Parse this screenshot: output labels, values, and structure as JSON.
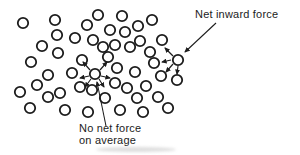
{
  "figure": {
    "type": "physics-diagram",
    "background_color": "#ffffff",
    "ink_color": "#1c1c1c",
    "labels": {
      "net_inward_force": "Net inward force",
      "no_net_force_line1": "No net force",
      "no_net_force_line2": "on average"
    },
    "molecule_radius": 5.2,
    "molecules": [
      [
        23,
        23
      ],
      [
        55,
        20
      ],
      [
        87,
        25
      ],
      [
        98,
        15
      ],
      [
        122,
        16
      ],
      [
        138,
        26
      ],
      [
        152,
        20
      ],
      [
        57,
        35
      ],
      [
        75,
        38
      ],
      [
        93,
        40
      ],
      [
        110,
        30
      ],
      [
        125,
        32
      ],
      [
        140,
        41
      ],
      [
        162,
        40
      ],
      [
        42,
        46
      ],
      [
        58,
        53
      ],
      [
        103,
        47
      ],
      [
        115,
        45
      ],
      [
        130,
        47
      ],
      [
        150,
        52
      ],
      [
        31,
        62
      ],
      [
        82,
        60
      ],
      [
        108,
        57
      ],
      [
        117,
        68
      ],
      [
        135,
        72
      ],
      [
        154,
        63
      ],
      [
        48,
        75
      ],
      [
        72,
        73
      ],
      [
        161,
        76
      ],
      [
        177,
        80
      ],
      [
        37,
        85
      ],
      [
        60,
        93
      ],
      [
        80,
        87
      ],
      [
        92,
        90
      ],
      [
        115,
        83
      ],
      [
        127,
        88
      ],
      [
        146,
        86
      ],
      [
        20,
        92
      ],
      [
        48,
        97
      ],
      [
        105,
        98
      ],
      [
        137,
        98
      ],
      [
        158,
        97
      ],
      [
        168,
        108
      ],
      [
        30,
        108
      ],
      [
        65,
        110
      ],
      [
        88,
        112
      ],
      [
        120,
        110
      ],
      [
        143,
        112
      ]
    ],
    "bulk_molecule": {
      "x": 95,
      "y": 74
    },
    "surface_molecule": {
      "x": 178,
      "y": 60
    },
    "bulk_force_arrows": [
      [
        90,
        70,
        83,
        62
      ],
      [
        100,
        70,
        107,
        62
      ],
      [
        89,
        76,
        80,
        78
      ],
      [
        101,
        76,
        110,
        78
      ],
      [
        91,
        79,
        85,
        87
      ],
      [
        99,
        79,
        104,
        87
      ]
    ],
    "surface_force_arrows": [
      [
        173,
        56,
        165,
        48
      ],
      [
        171,
        60,
        162,
        62
      ],
      [
        173,
        64,
        166,
        72
      ],
      [
        178,
        66,
        177,
        74
      ]
    ],
    "net_inward_pointer": {
      "x1": 216,
      "y1": 23,
      "x2": 185,
      "y2": 52
    },
    "no_net_pointer": {
      "x1": 106,
      "y1": 126,
      "x2": 97,
      "y2": 82
    }
  }
}
